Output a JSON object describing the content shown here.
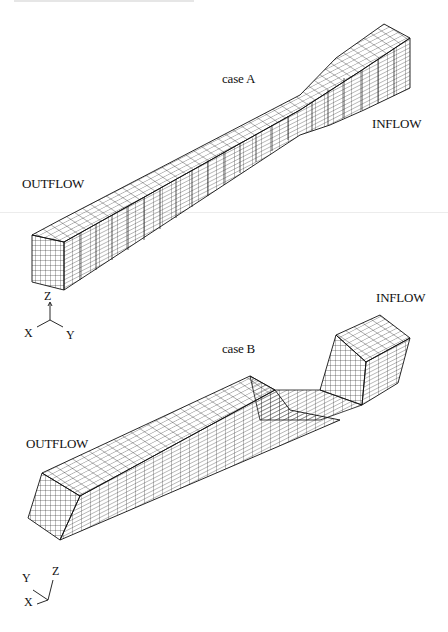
{
  "figure": {
    "panels": [
      {
        "id": "case-a",
        "title": "case A",
        "inflow_label": "INFLOW",
        "outflow_label": "OUTFLOW",
        "axes": {
          "z": "Z",
          "x": "X",
          "y": "Y"
        },
        "description": "Straight rectangular duct with a converging (contraction) section near the inflow end"
      },
      {
        "id": "case-b",
        "title": "case B",
        "inflow_label": "INFLOW",
        "outflow_label": "OUTFLOW",
        "axes": {
          "z": "Z",
          "x": "X",
          "y": "Y"
        },
        "description": "Duct with a vertical step/drop in height between inflow block and outflow channel"
      }
    ],
    "line_color": "#1a1a1a",
    "background": "#ffffff"
  }
}
